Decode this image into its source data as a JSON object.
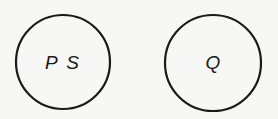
{
  "diagram": {
    "nodes": [
      {
        "id": "ps",
        "label": "P S",
        "cx": 63,
        "cy": 62,
        "r": 47
      },
      {
        "id": "q",
        "label": "Q",
        "cx": 213,
        "cy": 63,
        "r": 48
      }
    ],
    "colors": {
      "background": "#f7f7f6",
      "stroke": "#1a1a1a"
    }
  }
}
